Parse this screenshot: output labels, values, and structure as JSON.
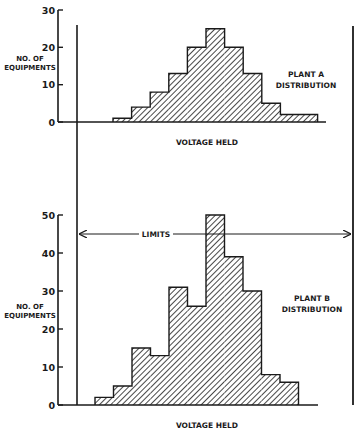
{
  "chart_data": [
    {
      "type": "bar",
      "title": "PLANT A DISTRIBUTION",
      "title_lines": [
        "PLANT A",
        "DISTRIBUTION"
      ],
      "xlabel": "VOLTAGE HELD",
      "ylabel": "NO. OF EQUIPMENTS",
      "ylabel_lines": [
        "NO. OF",
        "EQUIPMENTS"
      ],
      "ylim": [
        0,
        30
      ],
      "yticks": [
        "0",
        "10",
        "20",
        "30"
      ],
      "ytick_values": [
        0,
        10,
        20,
        30
      ],
      "values": [
        1,
        4,
        8,
        13,
        20,
        25,
        20,
        13,
        5,
        2,
        2
      ],
      "grid": false,
      "style": "histogram, diagonal hatching"
    },
    {
      "type": "bar",
      "title": "PLANT B DISTRIBUTION",
      "title_lines": [
        "PLANT B",
        "DISTRIBUTION"
      ],
      "xlabel": "VOLTAGE HELD",
      "ylabel": "NO. OF EQUIPMENTS",
      "ylabel_lines": [
        "NO. OF",
        "EQUIPMENTS"
      ],
      "ylim": [
        0,
        50
      ],
      "yticks": [
        "0",
        "10",
        "20",
        "30",
        "40",
        "50"
      ],
      "ytick_values": [
        0,
        10,
        20,
        30,
        40,
        50
      ],
      "values": [
        2,
        5,
        15,
        13,
        31,
        26,
        50,
        39,
        30,
        8,
        6
      ],
      "grid": false,
      "style": "histogram, diagonal hatching"
    }
  ],
  "annotations": {
    "limits_label": "LIMITS"
  },
  "colors": {
    "ink": "#1a1a1a",
    "background": "#ffffff"
  }
}
